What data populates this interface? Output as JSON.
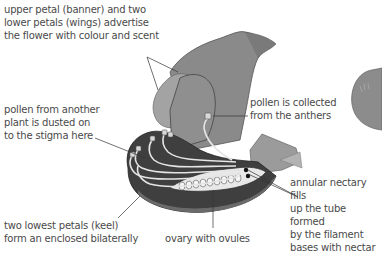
{
  "labels": {
    "banner_wings": "upper petal (banner) and two\nlower petals (wings) advertise\nthe flower with colour and scent",
    "pollen_stigma": "pollen from another\nplant is dusted on\nto the stigma here",
    "pollen_collected": "pollen is collected\nfrom the anthers",
    "nectary": "annular nectary fills\nup the tube formed\nby the filament\nbases with nectar",
    "keel": "two lowest petals (keel)\nform an enclosed bilaterally",
    "ovary": "ovary with ovules"
  },
  "colors": {
    "petal_light": "#9a9a9a",
    "petal_mid": "#7d7d7d",
    "petal_dark": "#5e5e5e",
    "keel_dark": "#3f3f3f",
    "leader_line": "#333333",
    "text": "#4a4a4a"
  }
}
